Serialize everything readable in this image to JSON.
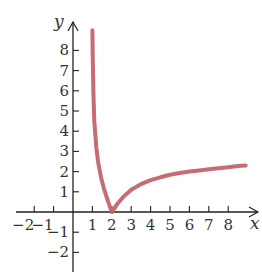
{
  "chart_data": {
    "type": "line",
    "title": "",
    "xlabel": "x",
    "ylabel": "y",
    "xlim": [
      -2.5,
      9.5
    ],
    "ylim": [
      -2.9,
      9.4
    ],
    "grid": false,
    "legend": null,
    "x_ticks": [
      -2,
      -1,
      1,
      2,
      3,
      4,
      5,
      6,
      7,
      8
    ],
    "x_tick_labels": [
      "−2",
      "−1",
      "1",
      "2",
      "3",
      "4",
      "5",
      "6",
      "7",
      "8"
    ],
    "y_ticks": [
      -2,
      -1,
      1,
      2,
      3,
      4,
      5,
      6,
      7,
      8
    ],
    "y_tick_labels": [
      "−2",
      "−1",
      "1",
      "2",
      "3",
      "4",
      "5",
      "6",
      "7",
      "8"
    ],
    "series": [
      {
        "name": "curve",
        "color": "#c4656a",
        "x": [
          1.0,
          1.02,
          1.05,
          1.1,
          1.2,
          1.3,
          1.45,
          1.6,
          1.8,
          2.0,
          2.3,
          2.6,
          3.0,
          3.5,
          4.0,
          4.5,
          5.0,
          5.5,
          6.0,
          6.5,
          7.0,
          7.5,
          8.0,
          8.5,
          8.9
        ],
        "y": [
          9.0,
          7.5,
          5.9,
          4.5,
          3.2,
          2.45,
          1.7,
          1.15,
          0.55,
          0.0,
          0.42,
          0.75,
          1.1,
          1.38,
          1.58,
          1.72,
          1.84,
          1.93,
          2.0,
          2.06,
          2.12,
          2.17,
          2.22,
          2.27,
          2.3
        ]
      }
    ]
  },
  "axes": {
    "x_label": "x",
    "y_label": "y",
    "axis_color": "#222222",
    "curve_color": "#c4656a"
  }
}
